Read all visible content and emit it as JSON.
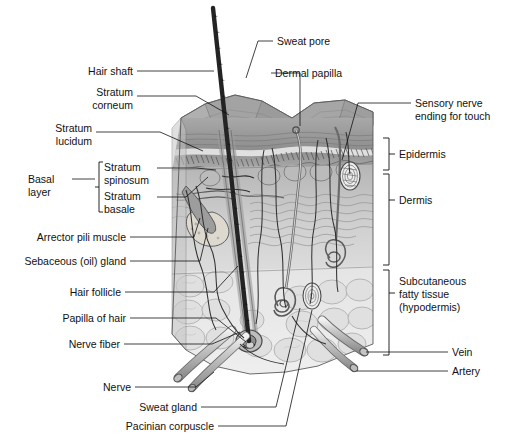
{
  "figure": {
    "style": "grayscale anatomical illustration",
    "colors": {
      "line": "#111111",
      "text": "#111111",
      "background": "#ffffff",
      "epidermis_surface": "#9a9a9a",
      "epidermis_deep": "#8d8d8d",
      "dermis": "#c9c9c9",
      "hypodermis": "#e2e2e2",
      "hair_shaft": "#262626",
      "vessel_outline": "#6e6e6e"
    }
  },
  "labels_left": [
    {
      "id": "hair-shaft",
      "text": "Hair shaft",
      "x": 133,
      "y": 75,
      "lines": [
        "Hair shaft"
      ]
    },
    {
      "id": "stratum-corneum",
      "text": "Stratum corneum",
      "x": 133,
      "y": 100,
      "lines": [
        "Stratum",
        "corneum"
      ]
    },
    {
      "id": "stratum-lucidum",
      "text": "Stratum lucidum",
      "x": 92,
      "y": 136,
      "lines": [
        "Stratum",
        "lucidum"
      ]
    },
    {
      "id": "stratum-spinosum",
      "text": "Stratum spinosum",
      "x": 153,
      "y": 172,
      "lines": [
        "Stratum",
        "spinosum"
      ]
    },
    {
      "id": "stratum-basale",
      "text": "Stratum basale",
      "x": 153,
      "y": 201,
      "lines": [
        "Stratum",
        "basale"
      ]
    },
    {
      "id": "basal-layer",
      "text": "Basal layer",
      "x": 68,
      "y": 183,
      "lines": [
        "Basal",
        "layer"
      ]
    },
    {
      "id": "arrector-pili-muscle",
      "text": "Arrector pili muscle",
      "x": 126,
      "y": 241,
      "lines": [
        "Arrector pili muscle"
      ]
    },
    {
      "id": "sebaceous-oil-gland",
      "text": "Sebaceous (oil) gland",
      "x": 126,
      "y": 265,
      "lines": [
        "Sebaceous (oil) gland"
      ]
    },
    {
      "id": "hair-follicle",
      "text": "Hair follicle",
      "x": 121,
      "y": 296,
      "lines": [
        "Hair follicle"
      ]
    },
    {
      "id": "papilla-of-hair",
      "text": "Papilla of hair",
      "x": 126,
      "y": 322,
      "lines": [
        "Papilla of hair"
      ]
    },
    {
      "id": "nerve-fiber",
      "text": "Nerve fiber",
      "x": 120,
      "y": 348,
      "lines": [
        "Nerve fiber"
      ]
    },
    {
      "id": "nerve",
      "text": "Nerve",
      "x": 131,
      "y": 391,
      "lines": [
        "Nerve"
      ]
    },
    {
      "id": "sweat-gland",
      "text": "Sweat gland",
      "x": 197,
      "y": 411,
      "lines": [
        "Sweat gland"
      ]
    },
    {
      "id": "pacinian-corpuscle",
      "text": "Pacinian corpuscle",
      "x": 214,
      "y": 430,
      "lines": [
        "Pacinian corpuscle"
      ]
    }
  ],
  "labels_top": [
    {
      "id": "sweat-pore",
      "text": "Sweat pore",
      "x": 277,
      "y": 45,
      "lines": [
        "Sweat pore"
      ]
    },
    {
      "id": "dermal-papilla",
      "text": "Dermal papilla",
      "x": 275,
      "y": 77,
      "lines": [
        "Dermal papilla"
      ]
    }
  ],
  "labels_right": [
    {
      "id": "sensory-nerve-ending",
      "text": "Sensory nerve ending for touch",
      "x": 415,
      "y": 107,
      "lines": [
        "Sensory nerve",
        "ending for touch"
      ]
    },
    {
      "id": "epidermis",
      "text": "Epidermis",
      "x": 401,
      "y": 155,
      "lines": [
        "Epidermis"
      ]
    },
    {
      "id": "dermis",
      "text": "Dermis",
      "x": 401,
      "y": 201,
      "lines": [
        "Dermis"
      ]
    },
    {
      "id": "subcutaneous-fatty-tissue",
      "text": "Subcutaneous fatty tissue (hypodermis)",
      "x": 398,
      "y": 294,
      "lines": [
        "Subcutaneous",
        "fatty tissue",
        "(hypodermis)"
      ]
    },
    {
      "id": "vein",
      "text": "Vein",
      "x": 452,
      "y": 355,
      "lines": [
        "Vein"
      ]
    },
    {
      "id": "artery",
      "text": "Artery",
      "x": 452,
      "y": 375,
      "lines": [
        "Artery"
      ]
    }
  ],
  "brackets": [
    {
      "id": "basal-layer-bracket",
      "orientation": "left",
      "x": 99,
      "y1": 162,
      "y2": 212
    },
    {
      "id": "epidermis-bracket",
      "orientation": "right",
      "x": 389,
      "y1": 138,
      "y2": 170
    },
    {
      "id": "dermis-bracket",
      "orientation": "right",
      "x": 389,
      "y1": 174,
      "y2": 265
    },
    {
      "id": "hypodermis-bracket",
      "orientation": "right",
      "x": 389,
      "y1": 270,
      "y2": 355
    }
  ]
}
